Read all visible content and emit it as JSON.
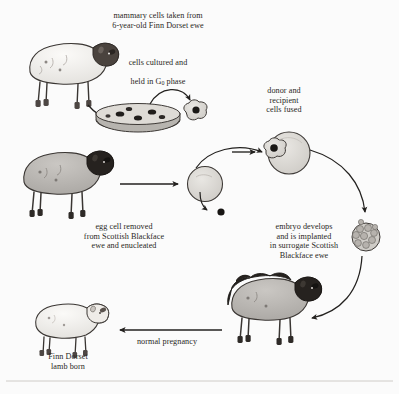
{
  "diagram": {
    "type": "process-flow",
    "background_color": "#fbfbfb",
    "ink_color": "#23211f"
  },
  "captions": {
    "mammary_cells": "mammary cells taken from\n6-year-old Finn Dorset ewe",
    "cells_cultured_line1": "cells cultured and",
    "cells_cultured_line2_pre": "held in G",
    "cells_cultured_subscript": "0",
    "cells_cultured_line2_post": " phase",
    "donor_fused": "donor and\nrecipient\ncells fused",
    "egg_removed": "egg cell removed\nfrom Scottish Blackface\newe and enucleated",
    "embryo_implanted": "embryo develops\nand is implanted\nin surrogate Scottish\nBlackface ewe",
    "normal_pregnancy": "normal pregnancy",
    "lamb_born": "Finn Dorset\nlamb born"
  },
  "figures": {
    "finn_dorset_ewe": "finn-dorset-ewe",
    "scottish_blackface_ewe": "scottish-blackface-ewe",
    "surrogate_ewe": "surrogate-scottish-blackface-ewe",
    "finn_dorset_lamb": "finn-dorset-lamb",
    "petri_dish": "petri-dish-with-cultured-cells",
    "donor_cell": "isolated-donor-cell",
    "egg_cell": "enucleated-egg-cell",
    "extracted_nucleus": "extracted-nucleus",
    "fused_cell": "fused-donor-recipient-cell",
    "embryo": "morula-embryo"
  },
  "colors": {
    "sheep_white_body": "#f3f1ee",
    "sheep_gray_body": "#b9b6b2",
    "sheep_dark_face": "#423c38",
    "cell_fill": "#d9d6d2",
    "dish_fill": "#cfccc8",
    "nucleus": "#1a1816",
    "arrow": "#23211f"
  }
}
